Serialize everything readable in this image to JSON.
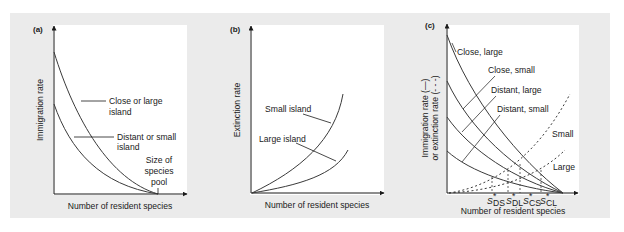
{
  "figure": {
    "panels": [
      {
        "id": "a",
        "label": "(a)",
        "ylabel": "Immigration rate",
        "xlabel": "Number of resident species",
        "curves": [
          {
            "label_line1": "Close or large",
            "label_line2": "island"
          },
          {
            "label_line1": "Distant or small",
            "label_line2": "island"
          }
        ],
        "annotation": [
          "Size of",
          "species",
          "pool"
        ]
      },
      {
        "id": "b",
        "label": "(b)",
        "ylabel": "Extinction rate",
        "xlabel": "Number of resident species",
        "curves": [
          {
            "label": "Small island"
          },
          {
            "label": "Large island"
          }
        ]
      },
      {
        "id": "c",
        "label": "(c)",
        "ylabel_line1": "Immigration rate (—)",
        "ylabel_line2": "or extinction rate (- - -)",
        "xlabel": "Number of resident species",
        "immigration_curves": [
          {
            "label": "Close, large"
          },
          {
            "label": "Close, small"
          },
          {
            "label": "Distant, large"
          },
          {
            "label": "Distant, small"
          }
        ],
        "extinction_curves": [
          {
            "label": "Small"
          },
          {
            "label": "Large"
          }
        ],
        "equilibria": [
          {
            "main": "S",
            "prime": "*",
            "sub": "DS"
          },
          {
            "main": "S",
            "prime": "*",
            "sub": "DL"
          },
          {
            "main": "S",
            "prime": "*",
            "sub": "CS"
          },
          {
            "main": "S",
            "prime": "*",
            "sub": "CL"
          }
        ]
      }
    ]
  },
  "colors": {
    "band": "#ebebeb",
    "plot": "#ffffff",
    "ink": "#1a1a1a",
    "curve": "#3a3a3a"
  }
}
